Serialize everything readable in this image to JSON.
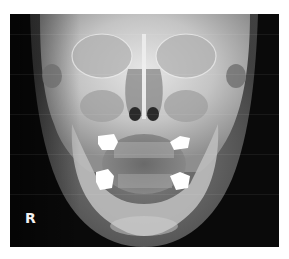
{
  "image": {
    "description": "PA skull radiograph (frontal X-ray of head)",
    "side_marker": "R",
    "colors": {
      "background": "#0a0a0a",
      "bone": "#d9d9d9",
      "soft_tissue": "#8a8a8a",
      "dense_restoration": "#ffffff",
      "page": "#ffffff"
    }
  }
}
